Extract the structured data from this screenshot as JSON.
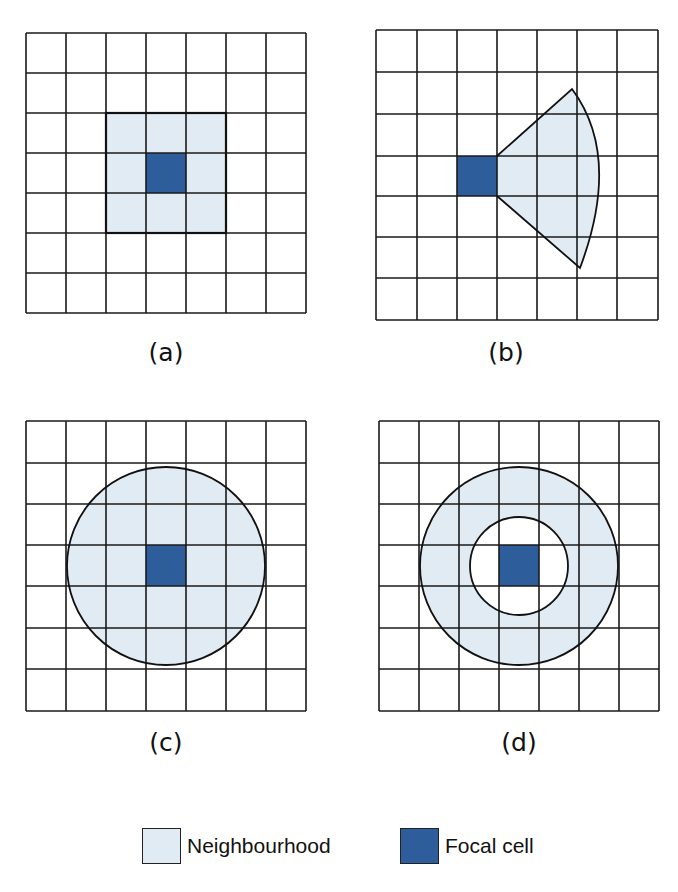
{
  "colors": {
    "neighbourhood": "#e1ebf3",
    "focal_cell": "#2d5d9b",
    "grid_line": "#1a1a1a",
    "background": "#ffffff"
  },
  "grid": {
    "rows": 7,
    "cols": 7,
    "cell_size_px": 40
  },
  "panels": [
    {
      "id": "a",
      "caption": "(a)",
      "shape": "square",
      "description": "3x3 square neighbourhood around focal cell",
      "focal_cell": {
        "row": 3,
        "col": 3
      }
    },
    {
      "id": "b",
      "caption": "(b)",
      "shape": "wedge",
      "description": "Wedge / sector neighbourhood extending right from focal cell",
      "focal_cell": {
        "row": 3,
        "col": 2
      }
    },
    {
      "id": "c",
      "caption": "(c)",
      "shape": "circle",
      "description": "Circular neighbourhood around focal cell",
      "focal_cell": {
        "row": 3,
        "col": 3
      }
    },
    {
      "id": "d",
      "caption": "(d)",
      "shape": "annulus",
      "description": "Annulus (ring) neighbourhood around focal cell",
      "focal_cell": {
        "row": 3,
        "col": 3
      }
    }
  ],
  "legend": {
    "items": [
      {
        "label": "Neighbourhood",
        "color": "#e1ebf3"
      },
      {
        "label": "Focal cell",
        "color": "#2d5d9b"
      }
    ]
  }
}
